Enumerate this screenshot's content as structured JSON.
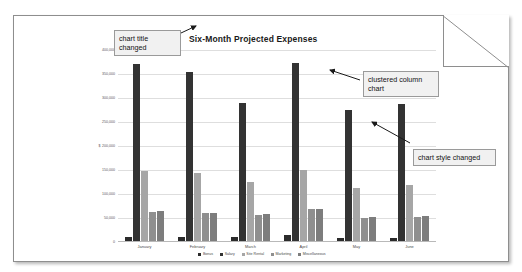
{
  "document": {
    "name": "chart-document-page"
  },
  "chart_data": {
    "type": "bar",
    "title": "Six-Month Projected Expenses",
    "xlabel": "",
    "ylabel": "",
    "ylim": [
      0,
      400000
    ],
    "grid": true,
    "legend_position": "bottom",
    "currency_symbol": "$",
    "categories": [
      "January",
      "February",
      "March",
      "April",
      "May",
      "June"
    ],
    "ytick_labels": [
      "0",
      "50,000",
      "100,000",
      "150,000",
      "200,000",
      "250,000",
      "300,000",
      "350,000",
      "400,000"
    ],
    "ytick_values": [
      0,
      50000,
      100000,
      150000,
      200000,
      250000,
      300000,
      350000,
      400000
    ],
    "currency_tick_label": "200,000",
    "series": [
      {
        "name": "Bonus",
        "color": "#2b2b2b",
        "values": [
          8000,
          8000,
          8000,
          12000,
          6000,
          6000
        ]
      },
      {
        "name": "Salary",
        "color": "#333333",
        "values": [
          368000,
          352000,
          287000,
          370000,
          272000,
          286000
        ]
      },
      {
        "name": "Site Rental",
        "color": "#a6a6a6",
        "values": [
          145000,
          142000,
          122000,
          148000,
          110000,
          116000
        ]
      },
      {
        "name": "Marketing",
        "color": "#8f8f8f",
        "values": [
          61000,
          58000,
          55000,
          66000,
          48000,
          50000
        ]
      },
      {
        "name": "Miscellaneous",
        "color": "#7d7d7d",
        "values": [
          62000,
          59000,
          57000,
          67000,
          49000,
          52000
        ]
      }
    ]
  },
  "annotations": {
    "title_callout": "chart title changed",
    "clustered_callout": "clustered column chart",
    "style_callout": "chart style changed"
  }
}
